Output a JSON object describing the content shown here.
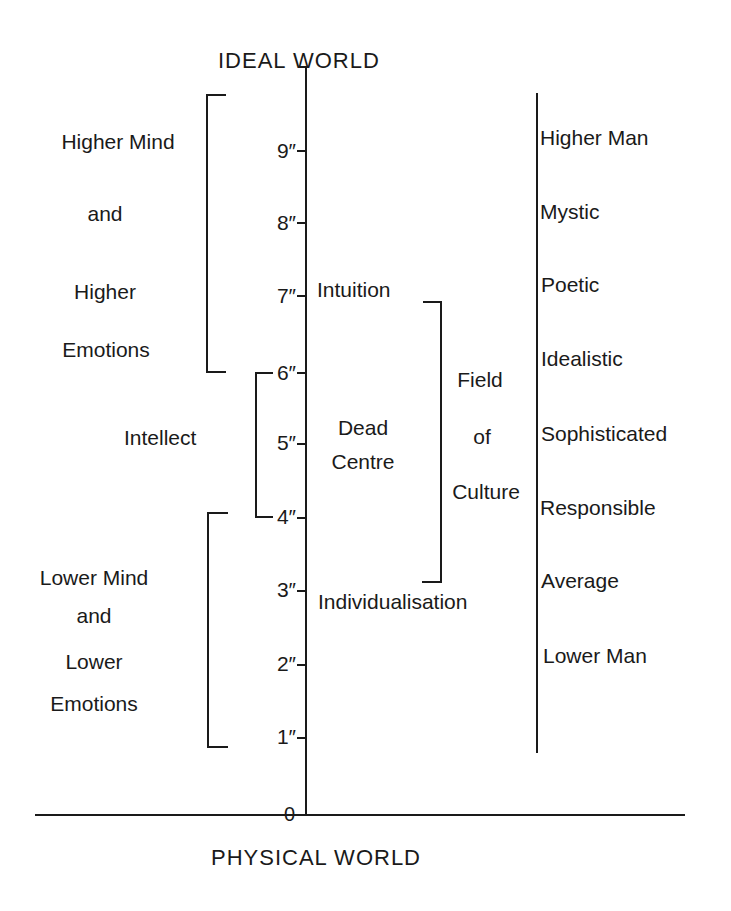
{
  "diagram": {
    "top_label": "IDEAL  WORLD",
    "bottom_label": "PHYSICAL  WORLD",
    "axis": {
      "origin_label": "0",
      "ticks": [
        {
          "value": 1,
          "label": "1″"
        },
        {
          "value": 2,
          "label": "2″"
        },
        {
          "value": 3,
          "label": "3″"
        },
        {
          "value": 4,
          "label": "4″"
        },
        {
          "value": 5,
          "label": "5″"
        },
        {
          "value": 6,
          "label": "6″"
        },
        {
          "value": 7,
          "label": "7″"
        },
        {
          "value": 8,
          "label": "8″"
        },
        {
          "value": 9,
          "label": "9″"
        }
      ]
    },
    "left_groups": {
      "higher": {
        "lines": [
          "Higher Mind",
          "and",
          "Higher",
          "Emotions"
        ],
        "range": [
          6,
          9.8
        ]
      },
      "intellect": {
        "label": "Intellect",
        "range": [
          4,
          6
        ]
      },
      "lower": {
        "lines": [
          "Lower Mind",
          "and",
          "Lower",
          "Emotions"
        ],
        "range": [
          1,
          4
        ]
      }
    },
    "center": {
      "intuition": "Intuition",
      "dead_centre": [
        "Dead",
        "Centre"
      ],
      "individualisation": "Individualisation",
      "field_of_culture": [
        "Field",
        "of",
        "Culture"
      ],
      "field_range": [
        3,
        7
      ]
    },
    "right_scale": [
      "Higher Man",
      "Mystic",
      "Poetic",
      "Idealistic",
      "Sophisticated",
      "Responsible",
      "Average",
      "Lower Man"
    ]
  }
}
